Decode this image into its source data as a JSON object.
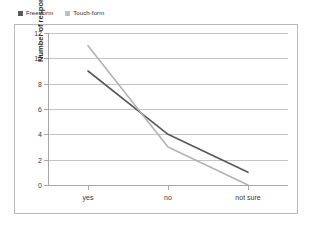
{
  "chart_data": {
    "type": "line",
    "title": "",
    "subtitle": "",
    "xlabel": "",
    "ylabel": "Number of respondents",
    "categories": [
      "yes",
      "no",
      "not sure"
    ],
    "series": [
      {
        "name": "Free-form",
        "values": [
          9,
          4,
          1
        ],
        "color": "#595959"
      },
      {
        "name": "Touch-form",
        "values": [
          11,
          3,
          0
        ],
        "color": "#b3b3b3"
      }
    ],
    "ylim": [
      0,
      12
    ],
    "ytick_step": 2,
    "yticks": [
      12,
      10,
      8,
      6,
      4,
      2,
      0
    ],
    "grid": "horizontal",
    "legend_position": "top-left",
    "annotations": []
  },
  "legend": {
    "items": [
      {
        "label": "Free-form",
        "swatch_color": "#595959",
        "marker": "square-swatch"
      },
      {
        "label": "Touch-form",
        "swatch_color": "#bfbfbf",
        "marker": "square-swatch"
      }
    ]
  },
  "axes": {
    "y_axis_title": "Number of respondents",
    "y_tick_labels": [
      "12",
      "10",
      "8",
      "6",
      "4",
      "2",
      "0"
    ],
    "x_tick_labels": [
      "yes",
      "no",
      "not sure"
    ]
  },
  "colors": {
    "frame_border": "#b9b9b9",
    "gridline": "#c5c5c5",
    "axis_line": "#a8a8a8",
    "text": "#3a3a3a",
    "background": "#ffffff"
  }
}
